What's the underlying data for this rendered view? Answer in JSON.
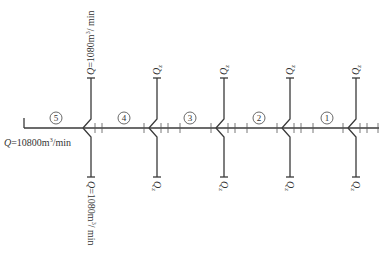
{
  "diagram": {
    "main_flow": {
      "q_symbol": "Q",
      "value": "=10800m",
      "sup": "3",
      "unit": "/min"
    },
    "segments": [
      {
        "label": "5",
        "x": 56
      },
      {
        "label": "4",
        "x": 124
      },
      {
        "label": "3",
        "x": 190
      },
      {
        "label": "2",
        "x": 259
      },
      {
        "label": "1",
        "x": 327
      }
    ],
    "junctions": [
      {
        "x": 91,
        "top_label": {
          "q": "Q",
          "text": "=1080m",
          "sup": "3",
          "unit": "/ min"
        },
        "bottom_label": {
          "q": "Q",
          "text": "=1080m",
          "sup": "3",
          "unit": "/ min"
        }
      },
      {
        "x": 157,
        "top_label": {
          "q": "Q",
          "sub": "z"
        },
        "bottom_label": {
          "q": "Q",
          "sub": "z"
        }
      },
      {
        "x": 224,
        "top_label": {
          "q": "Q",
          "sub": "z"
        },
        "bottom_label": {
          "q": "Q",
          "sub": "z"
        }
      },
      {
        "x": 290,
        "top_label": {
          "q": "Q",
          "sub": "z"
        },
        "bottom_label": {
          "q": "Q",
          "sub": "z"
        }
      },
      {
        "x": 356,
        "top_label": {
          "q": "Q",
          "sub": "z"
        },
        "bottom_label": {
          "q": "Q",
          "sub": "z"
        }
      }
    ],
    "colors": {
      "line": "#3a3a3a",
      "text": "#333333",
      "background": "#ffffff"
    }
  }
}
